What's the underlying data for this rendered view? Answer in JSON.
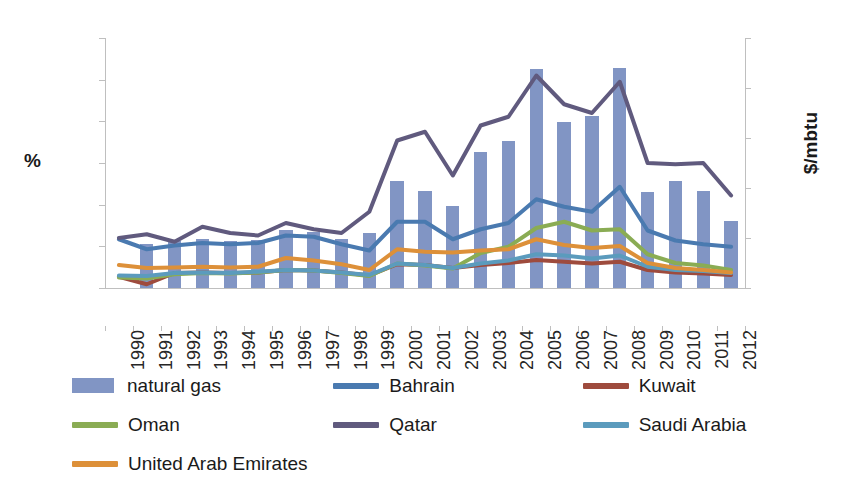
{
  "chart_data": {
    "type": "bar",
    "title": "",
    "xlabel": "",
    "ylabel": "%",
    "ylabel_secondary": "$/mbtu",
    "ylim": [
      0,
      30
    ],
    "ylim_secondary": [
      0,
      10
    ],
    "ytick_labels": [
      "0",
      "5",
      "10",
      "15",
      "20",
      "25",
      "30"
    ],
    "ytick_values": [
      0,
      5,
      10,
      15,
      20,
      25,
      30
    ],
    "ytick_labels_secondary": [
      "0",
      "2",
      "4",
      "6",
      "8",
      "10"
    ],
    "ytick_values_secondary": [
      0,
      2,
      4,
      6,
      8,
      10
    ],
    "grid": false,
    "legend_position": "bottom",
    "categories": [
      "1990",
      "1991",
      "1992",
      "1993",
      "1994",
      "1995",
      "1996",
      "1997",
      "1998",
      "1999",
      "2000",
      "2001",
      "2002",
      "2003",
      "2004",
      "2005",
      "2006",
      "2007",
      "2008",
      "2009",
      "2010",
      "2011",
      "2012"
    ],
    "bar_series": {
      "name": "natural gas",
      "axis": "left",
      "unit": "%",
      "color": "#8195c4",
      "values": [
        0,
        5.3,
        5.6,
        5.9,
        5.7,
        5.8,
        7.0,
        6.7,
        5.9,
        6.6,
        12.8,
        11.7,
        9.9,
        16.3,
        17.7,
        26.3,
        19.9,
        20.7,
        26.4,
        11.5,
        12.8,
        11.7,
        8.0
      ]
    },
    "series": [
      {
        "name": "Bahrain",
        "axis": "right",
        "unit": "$/mbtu",
        "color": "#4a7ab0",
        "values": [
          1.95,
          1.55,
          1.7,
          1.8,
          1.75,
          1.8,
          2.1,
          2.05,
          1.75,
          1.5,
          2.65,
          2.65,
          1.95,
          2.35,
          2.6,
          3.55,
          3.25,
          3.05,
          4.05,
          2.3,
          1.9,
          1.75,
          1.65
        ]
      },
      {
        "name": "Kuwait",
        "axis": "right",
        "unit": "$/mbtu",
        "color": "#9e4b3d",
        "values": [
          0.45,
          0.15,
          0.6,
          0.62,
          0.6,
          0.62,
          0.72,
          0.7,
          0.62,
          0.5,
          0.95,
          0.92,
          0.8,
          0.92,
          1.0,
          1.12,
          1.05,
          0.98,
          1.05,
          0.72,
          0.62,
          0.58,
          0.52
        ]
      },
      {
        "name": "Oman",
        "axis": "right",
        "unit": "$/mbtu",
        "color": "#8aac54",
        "values": [
          0.42,
          0.38,
          0.55,
          0.6,
          0.58,
          0.62,
          0.72,
          0.7,
          0.6,
          0.48,
          0.98,
          0.9,
          0.78,
          1.4,
          1.65,
          2.4,
          2.65,
          2.3,
          2.35,
          1.35,
          1.0,
          0.9,
          0.72
        ]
      },
      {
        "name": "Qatar",
        "axis": "right",
        "unit": "$/mbtu",
        "color": "#605a7e",
        "values": [
          2.0,
          2.15,
          1.85,
          2.45,
          2.2,
          2.1,
          2.6,
          2.35,
          2.2,
          3.05,
          5.9,
          6.25,
          4.5,
          6.5,
          6.85,
          8.5,
          7.35,
          7.0,
          8.25,
          5.0,
          4.95,
          5.0,
          3.7
        ]
      },
      {
        "name": "Saudi Arabia",
        "axis": "right",
        "unit": "$/mbtu",
        "color": "#5b9bbd",
        "values": [
          0.5,
          0.48,
          0.6,
          0.62,
          0.6,
          0.65,
          0.72,
          0.7,
          0.62,
          0.52,
          0.98,
          0.92,
          0.8,
          0.98,
          1.1,
          1.35,
          1.3,
          1.18,
          1.3,
          0.85,
          0.72,
          0.68,
          0.6
        ]
      },
      {
        "name": "United Arab Emirates",
        "axis": "right",
        "unit": "$/mbtu",
        "color": "#dd9039",
        "values": [
          0.92,
          0.8,
          0.82,
          0.85,
          0.82,
          0.85,
          1.2,
          1.1,
          0.95,
          0.72,
          1.55,
          1.45,
          1.42,
          1.5,
          1.55,
          1.95,
          1.72,
          1.6,
          1.68,
          1.0,
          0.8,
          0.72,
          0.62
        ]
      }
    ]
  },
  "legend": {
    "items": [
      {
        "label": "natural gas",
        "marker": "bar",
        "color": "#8195c4"
      },
      {
        "label": "Bahrain",
        "marker": "line",
        "color": "#4a7ab0"
      },
      {
        "label": "Kuwait",
        "marker": "line",
        "color": "#9e4b3d"
      },
      {
        "label": "Oman",
        "marker": "line",
        "color": "#8aac54"
      },
      {
        "label": "Qatar",
        "marker": "line",
        "color": "#605a7e"
      },
      {
        "label": "Saudi Arabia",
        "marker": "line",
        "color": "#5b9bbd"
      },
      {
        "label": "United Arab Emirates",
        "marker": "line",
        "color": "#dd9039"
      }
    ]
  }
}
